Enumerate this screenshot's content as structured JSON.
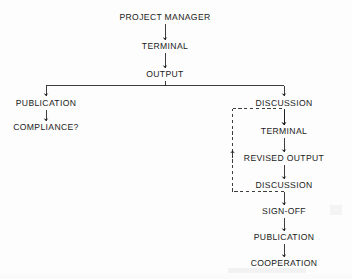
{
  "diagram": {
    "type": "flowchart",
    "background_color": "#fdfdfd",
    "stroke_color": "#1b1b1b",
    "nodes": [
      {
        "id": "project-manager",
        "label": "PROJECT MANAGER",
        "x": 165,
        "y": 17
      },
      {
        "id": "terminal-top",
        "label": "TERMINAL",
        "x": 165,
        "y": 46
      },
      {
        "id": "output",
        "label": "OUTPUT",
        "x": 165,
        "y": 74
      },
      {
        "id": "publication-left",
        "label": "PUBLICATION",
        "x": 46,
        "y": 103
      },
      {
        "id": "compliance",
        "label": "COMPLIANCE?",
        "x": 46,
        "y": 127
      },
      {
        "id": "discussion-1",
        "label": "DISCUSSION",
        "x": 284,
        "y": 103
      },
      {
        "id": "terminal-loop",
        "label": "TERMINAL",
        "x": 284,
        "y": 131
      },
      {
        "id": "revised-output",
        "label": "REVISED OUTPUT",
        "x": 284,
        "y": 158
      },
      {
        "id": "discussion-2",
        "label": "DISCUSSION",
        "x": 284,
        "y": 185
      },
      {
        "id": "sign-off",
        "label": "SIGN-OFF",
        "x": 284,
        "y": 211
      },
      {
        "id": "publication-right",
        "label": "PUBLICATION",
        "x": 284,
        "y": 237
      },
      {
        "id": "cooperation",
        "label": "COOPERATION",
        "x": 284,
        "y": 263
      }
    ],
    "edges": [
      {
        "from": "project-manager",
        "to": "terminal-top",
        "style": "solid"
      },
      {
        "from": "terminal-top",
        "to": "output",
        "style": "solid"
      },
      {
        "from": "output",
        "to": "publication-left",
        "style": "solid"
      },
      {
        "from": "output",
        "to": "discussion-1",
        "style": "solid"
      },
      {
        "from": "publication-left",
        "to": "compliance",
        "style": "solid"
      },
      {
        "from": "discussion-1",
        "to": "terminal-loop",
        "style": "solid"
      },
      {
        "from": "terminal-loop",
        "to": "revised-output",
        "style": "solid"
      },
      {
        "from": "revised-output",
        "to": "discussion-2",
        "style": "solid"
      },
      {
        "from": "discussion-2",
        "to": "sign-off",
        "style": "solid"
      },
      {
        "from": "sign-off",
        "to": "publication-right",
        "style": "solid"
      },
      {
        "from": "publication-right",
        "to": "cooperation",
        "style": "solid"
      },
      {
        "from": "discussion-2",
        "to": "terminal-loop",
        "style": "dashed",
        "note": "feedback loop"
      }
    ]
  }
}
